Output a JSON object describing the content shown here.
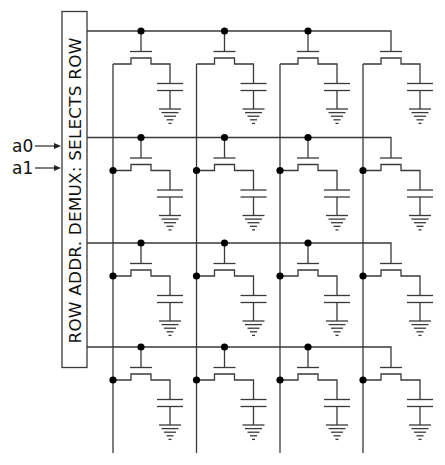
{
  "demux": {
    "label": "ROW ADDR. DEMUX: SELECTS ROW",
    "box": {
      "x": 62,
      "y": 11.5,
      "w": 25,
      "h": 356
    }
  },
  "inputs": [
    {
      "label": "a0",
      "y": 146
    },
    {
      "label": "a1",
      "y": 168
    }
  ],
  "colors": {
    "wire": "#3a3a3a",
    "dot": "#000000",
    "text": "#111111"
  },
  "grid": {
    "rows": 4,
    "cols": 4,
    "word_lines_y": [
      31,
      137.5,
      243,
      347
    ],
    "bit_lines_x": [
      113,
      196.5,
      280,
      363
    ],
    "gate_x": [
      141,
      224.5,
      308,
      391
    ],
    "bit_line_bottom_y": 453,
    "word_line_start_x": 87
  },
  "cell": {
    "components": [
      "access-transistor",
      "storage-capacitor",
      "ground"
    ]
  }
}
